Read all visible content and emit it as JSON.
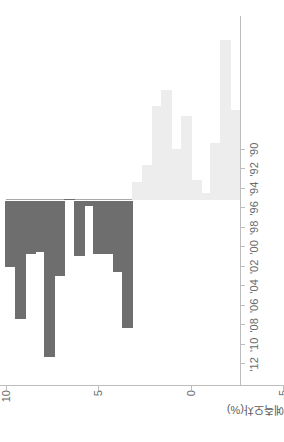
{
  "chart_data": {
    "type": "bar",
    "title": "",
    "subtitle": "",
    "xlabel": "",
    "ylabel": "예측오차(%)",
    "orientation": "horizontal-bars-rotated-90ccw",
    "grid": false,
    "legend": "none",
    "ylim": [
      -10,
      10
    ],
    "ytick_labels": [
      "10",
      "5",
      "0",
      "-5",
      "-10"
    ],
    "ytick_values": [
      10,
      5,
      0,
      -5,
      -10
    ],
    "categories": [
      "'90",
      "'91",
      "'92",
      "'93",
      "'94",
      "'95",
      "'96",
      "'97",
      "'98",
      "'99",
      "'00",
      "'01",
      "'02",
      "'03",
      "'04",
      "'05",
      "'06",
      "'07",
      "'08",
      "'09",
      "'10",
      "'11",
      "'12",
      "'13"
    ],
    "xtick_labels": [
      "'90",
      "'92",
      "'94",
      "'96",
      "'98",
      "'00",
      "'02",
      "'04",
      "'06",
      "'08",
      "'10",
      "'12"
    ],
    "xtick_categories": [
      "'90",
      "'92",
      "'94",
      "'96",
      "'98",
      "'00",
      "'02",
      "'04",
      "'06",
      "'08",
      "'10",
      "'12"
    ],
    "values": [
      -4.9,
      -8.7,
      -3.1,
      -0.4,
      -1.1,
      -4.6,
      -2.8,
      -6.0,
      -5.1,
      -1.9,
      -1.0,
      6.9,
      3.9,
      2.9,
      2.9,
      0.3,
      3.0,
      0.0,
      4.1,
      8.5,
      2.8,
      2.9,
      6.4,
      3.6
    ],
    "series": [
      {
        "name": "예측오차(%)",
        "values": [
          -4.9,
          -8.7,
          -3.1,
          -0.4,
          -1.1,
          -4.6,
          -2.8,
          -6.0,
          -5.1,
          -1.9,
          -1.0,
          6.9,
          3.9,
          2.9,
          2.9,
          0.3,
          3.0,
          0.0,
          4.1,
          8.5,
          2.8,
          2.9,
          6.4,
          3.6
        ]
      }
    ],
    "colors": {
      "positive_bar": "#6e6e6e",
      "negative_bar": "#ededed",
      "axis": "#bdbdbd",
      "tick_text": "#6b6b6b",
      "axis_title": "#5e5e5e",
      "background": "#ffffff"
    }
  }
}
